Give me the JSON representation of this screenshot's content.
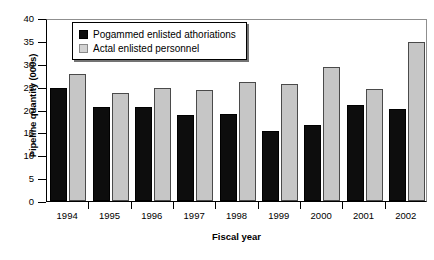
{
  "chart_data": {
    "type": "bar",
    "title": "",
    "xlabel": "Fiscal year",
    "ylabel": "Pipeline quantity (000s)",
    "ylim": [
      0,
      40
    ],
    "ytick_step": 5,
    "yticks": [
      "40",
      "35",
      "30",
      "25",
      "20",
      "15",
      "10",
      "5",
      "0"
    ],
    "grid": false,
    "legend_position": "top-left-inside",
    "categories": [
      "1994",
      "1995",
      "1996",
      "1997",
      "1998",
      "1999",
      "2000",
      "2001",
      "2002"
    ],
    "series": [
      {
        "name": "Pogammed enlisted athoriations",
        "color": "#0d0d0d",
        "values": [
          24.6,
          20.6,
          20.6,
          18.8,
          19.1,
          15.3,
          16.6,
          21.0,
          20.2
        ]
      },
      {
        "name": "Actal enlisted personnel",
        "color": "#c6c6c6",
        "values": [
          27.7,
          23.6,
          24.7,
          24.3,
          26.1,
          25.6,
          29.4,
          24.4,
          34.7
        ]
      }
    ]
  }
}
